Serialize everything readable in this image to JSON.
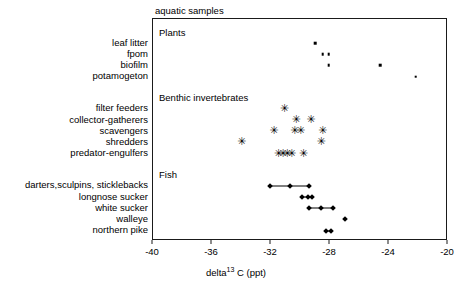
{
  "chart_data": {
    "type": "scatter",
    "title": "aquatic samples",
    "xlabel_prefix": "delta",
    "xlabel_sup": "13",
    "xlabel_suffix": " C (ppt)",
    "xlabel_full": "delta13 C (ppt)",
    "ylabel": "",
    "xlim": [
      -40,
      -20
    ],
    "xticks": [
      -40,
      -36,
      -32,
      -28,
      -24,
      -20
    ],
    "xticklabels": [
      "-40",
      "-36",
      "-32",
      "-28",
      "-24",
      "-20"
    ],
    "grid": false,
    "legend": "none",
    "groups": [
      {
        "name": "Plants",
        "heading": "Plants",
        "marker": "square",
        "connected": false,
        "rows": [
          {
            "label": "leaf litter",
            "values": [
              -29.0
            ]
          },
          {
            "label": "fpom",
            "values": [
              -28.5,
              -28.1
            ]
          },
          {
            "label": "biofilm",
            "values": [
              -28.1,
              -24.6
            ]
          },
          {
            "label": "potamogeton",
            "values": [
              -22.2
            ]
          }
        ]
      },
      {
        "name": "Benthic invertebrates",
        "heading": "Benthic invertebrates",
        "marker": "star",
        "connected": false,
        "rows": [
          {
            "label": "filter feeders",
            "values": [
              -31.1
            ]
          },
          {
            "label": "collector-gatherers",
            "values": [
              -30.3,
              -29.3
            ]
          },
          {
            "label": "scavengers",
            "values": [
              -31.8,
              -30.4,
              -30.0,
              -28.5
            ]
          },
          {
            "label": "shredders",
            "values": [
              -34.0,
              -28.6
            ]
          },
          {
            "label": "predator-engulfers",
            "values": [
              -31.5,
              -31.2,
              -30.9,
              -30.6,
              -29.8
            ]
          }
        ]
      },
      {
        "name": "Fish",
        "heading": "Fish",
        "marker": "diamond",
        "connected": true,
        "rows": [
          {
            "label": "darters,sculpins, sticklebacks",
            "values": [
              -32.1,
              -30.7,
              -29.4
            ]
          },
          {
            "label": "longnose sucker",
            "values": [
              -29.9,
              -29.5,
              -29.2
            ]
          },
          {
            "label": "white sucker",
            "values": [
              -29.4,
              -28.6,
              -27.8
            ]
          },
          {
            "label": "walleye",
            "values": [
              -27.0
            ]
          },
          {
            "label": "northern pike",
            "values": [
              -28.3,
              -27.9
            ]
          }
        ]
      }
    ]
  },
  "marker_glyphs": {
    "star": "✳"
  },
  "colors": {
    "marker": "#000000",
    "axis": "#1a1a1a",
    "background": "#ffffff"
  }
}
